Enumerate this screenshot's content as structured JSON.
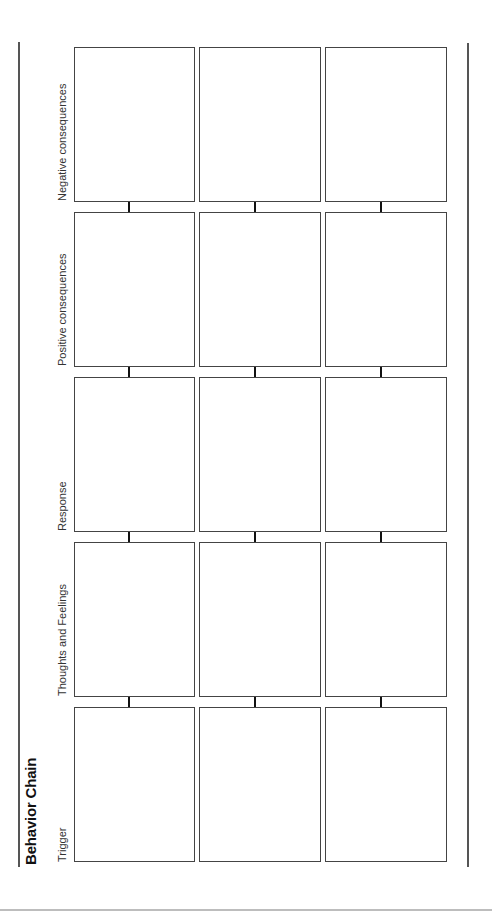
{
  "document": {
    "title": "Behavior Chain",
    "columns": [
      {
        "label": "Trigger"
      },
      {
        "label": "Thoughts and Feelings"
      },
      {
        "label": "Response"
      },
      {
        "label": "Positive consequences"
      },
      {
        "label": "Negative consequences"
      }
    ],
    "rows_count": 3,
    "colors": {
      "box_border": "#444444",
      "arrow": "#111111",
      "rule": "#555555",
      "bottom_rule": "#bdbdbd"
    }
  }
}
